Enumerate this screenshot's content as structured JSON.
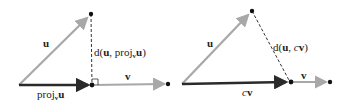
{
  "colors": {
    "u_vector": "#a8a8a8",
    "proj_vector": "#2a2a2a",
    "v_vector": "#a8a8a8",
    "dashed": "#333333",
    "point": "#111111",
    "text": "#222222"
  },
  "left_diagram": {
    "label_u": "u",
    "label_distance_prefix": "d(",
    "label_distance_u": "u",
    "label_distance_sep": ", proj",
    "label_distance_sub": "v",
    "label_distance_u2": "u",
    "label_distance_suffix": ")",
    "label_v": "v",
    "label_proj": "proj",
    "label_proj_sub": "v",
    "label_proj_u": "u"
  },
  "right_diagram": {
    "label_u": "u",
    "label_distance_prefix": "d(",
    "label_distance_u": "u",
    "label_distance_sep": ", ",
    "label_distance_c": "c",
    "label_distance_v": "v",
    "label_distance_suffix": ")",
    "label_v": "v",
    "label_cv_c": "c",
    "label_cv_v": "v"
  }
}
